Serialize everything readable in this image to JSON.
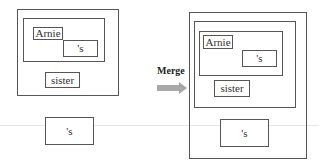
{
  "diagram": {
    "type": "merge",
    "operation_label": "Merge",
    "arrow_color": "#a8a8a8",
    "left": {
      "tree": {
        "inner_words": [
          {
            "id": "arnie",
            "label": "Arnie"
          },
          {
            "id": "poss",
            "label": "'s"
          }
        ],
        "sister": {
          "label": "sister"
        }
      },
      "separate": {
        "label": "'s"
      }
    },
    "right": {
      "inner_words": [
        {
          "id": "arnie",
          "label": "Arnie"
        },
        {
          "id": "poss",
          "label": "'s"
        }
      ],
      "sister": {
        "label": "sister"
      },
      "merged_poss": {
        "label": "'s"
      }
    }
  }
}
